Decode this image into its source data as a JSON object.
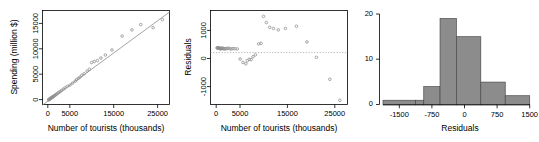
{
  "figure": {
    "panel_count": 3,
    "background_color": "#ffffff",
    "point_color": "#909090",
    "line_color": "#8a8a8a",
    "bar_fill_color": "#8c8c8c",
    "bar_border_color": "#4a4a4a"
  },
  "chart_data": [
    {
      "type": "scatter",
      "title": "",
      "xlabel": "Number of tourists (thousands)",
      "ylabel": "Spending (million $)",
      "xlim": [
        -1200,
        27500
      ],
      "ylim": [
        -900,
        17800
      ],
      "xticks": [
        0,
        5000,
        15000,
        25000
      ],
      "xtick_labels": [
        "0",
        "5000",
        "15000",
        "25000"
      ],
      "yticks": [
        0,
        5000,
        10000,
        15000
      ],
      "ytick_labels": [
        "0",
        "5000",
        "10000",
        "15000"
      ],
      "grid": false,
      "legend": "none",
      "has_fit_line": true,
      "fit_line": {
        "intercept": -250,
        "slope": 0.645
      },
      "x": [
        180,
        260,
        330,
        420,
        520,
        610,
        700,
        790,
        880,
        980,
        1080,
        1180,
        1300,
        1450,
        1600,
        1800,
        2000,
        2250,
        2500,
        2800,
        3100,
        3500,
        3900,
        4400,
        5000,
        5600,
        6200,
        6500,
        6900,
        7300,
        7700,
        8200,
        8900,
        9400,
        9900,
        10500,
        11200,
        12000,
        13000,
        14500,
        16800,
        19000,
        21000,
        23800,
        25900
      ],
      "y": [
        40,
        80,
        130,
        180,
        250,
        300,
        360,
        420,
        470,
        520,
        600,
        660,
        740,
        830,
        910,
        1050,
        1180,
        1340,
        1520,
        1700,
        1880,
        2150,
        2400,
        2700,
        2950,
        3350,
        3750,
        4050,
        4300,
        4550,
        4900,
        5200,
        5750,
        6100,
        7450,
        7650,
        7850,
        8350,
        8950,
        9950,
        12700,
        13950,
        15000,
        14400,
        16000
      ]
    },
    {
      "type": "scatter",
      "title": "",
      "xlabel": "Number of tourists (thousands)",
      "ylabel": "Residuals",
      "xlim": [
        -1200,
        27500
      ],
      "ylim": [
        -1850,
        1500
      ],
      "xticks": [
        0,
        5000,
        15000,
        25000
      ],
      "xtick_labels": [
        "0",
        "5000",
        "15000",
        "25000"
      ],
      "yticks": [
        -1000,
        0,
        1000
      ],
      "ytick_labels": [
        "-1000",
        "0",
        "1000"
      ],
      "grid": false,
      "legend": "none",
      "has_zero_line": true,
      "zero_line_y": 0,
      "x": [
        180,
        260,
        330,
        420,
        520,
        610,
        700,
        790,
        880,
        980,
        1080,
        1180,
        1300,
        1450,
        1600,
        1800,
        2000,
        2250,
        2500,
        2800,
        3100,
        3500,
        3900,
        4400,
        5000,
        5600,
        6200,
        6500,
        6900,
        7300,
        7700,
        8200,
        8900,
        9400,
        9900,
        10500,
        11200,
        12000,
        13000,
        14500,
        16800,
        19000,
        21000,
        23800,
        25900
      ],
      "y": [
        170,
        160,
        170,
        160,
        170,
        150,
        150,
        150,
        140,
        130,
        160,
        150,
        150,
        150,
        130,
        140,
        140,
        140,
        160,
        140,
        130,
        140,
        140,
        130,
        -230,
        -350,
        -400,
        -290,
        -240,
        -250,
        -150,
        -80,
        310,
        330,
        1290,
        1070,
        900,
        860,
        810,
        860,
        940,
        380,
        -170,
        -950,
        -1700
      ]
    },
    {
      "type": "bar",
      "title": "",
      "xlabel": "Residuals",
      "ylabel": "",
      "xlim": [
        -1875,
        1500
      ],
      "ylim": [
        0,
        20
      ],
      "xticks": [
        -1500,
        -750,
        0,
        750,
        1500
      ],
      "xtick_labels": [
        "-1500",
        "-750",
        "0",
        "750",
        "1500"
      ],
      "yticks": [
        0,
        10,
        20
      ],
      "ytick_labels": [
        "0",
        "10",
        "20"
      ],
      "grid": false,
      "legend": "none",
      "bin_edges": [
        -1875,
        -1500,
        -1125,
        -750,
        -375,
        0,
        375,
        750,
        1125,
        1500
      ],
      "bin_labels": [
        "-1875 to -1500",
        "-1500 to -1125",
        "-1125 to -750",
        "-750 to -375",
        "-375 to 0",
        "0 to 375",
        "375 to 750",
        "750 to 1125",
        "1125 to 1500"
      ],
      "categories": [
        "-1875",
        "-1500",
        "-1125",
        "-750",
        "-375",
        "0",
        "375",
        "750",
        "1125"
      ],
      "values": [
        1,
        1,
        1,
        4,
        4,
        19,
        19,
        15,
        15,
        5,
        5,
        2
      ],
      "bars": [
        {
          "x0": -1875,
          "x1": -1125,
          "count": 1
        },
        {
          "x0": -1125,
          "x1": -937.5,
          "count": 1
        },
        {
          "x0": -937.5,
          "x1": -562.5,
          "count": 4
        },
        {
          "x0": -562.5,
          "x1": -187.5,
          "count": 19
        },
        {
          "x0": -187.5,
          "x1": 375,
          "count": 15
        },
        {
          "x0": 375,
          "x1": 937.5,
          "count": 5
        },
        {
          "x0": 937.5,
          "x1": 1500,
          "count": 2
        }
      ]
    }
  ]
}
